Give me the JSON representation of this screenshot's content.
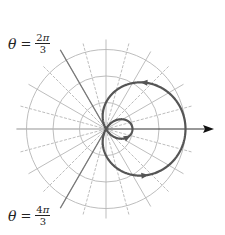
{
  "chart_data": {
    "type": "line",
    "subtype": "polar",
    "title": "",
    "equation_implied": "r = 1 + 2cos(theta)",
    "curve_name": "limacon with inner loop",
    "grid": {
      "rings": [
        1,
        2,
        3
      ],
      "radial_step_degrees": 15,
      "on": true
    },
    "polar_axis": {
      "direction": "right",
      "arrow": true
    },
    "highlighted_rays": [
      {
        "theta": "2π/3",
        "label": {
          "lhs": "θ",
          "eq": "=",
          "num_coef": "2",
          "num_sym": "π",
          "den": "3"
        }
      },
      {
        "theta": "4π/3",
        "label": {
          "lhs": "θ",
          "eq": "=",
          "num_coef": "4",
          "num_sym": "π",
          "den": "3"
        }
      }
    ],
    "key_points": [
      {
        "theta": "0",
        "r": 3
      },
      {
        "theta": "π/2",
        "r": 1
      },
      {
        "theta": "2π/3",
        "r": 0
      },
      {
        "theta": "π",
        "r": -1
      },
      {
        "theta": "4π/3",
        "r": 0
      },
      {
        "theta": "3π/2",
        "r": 1
      }
    ],
    "rlim": [
      0,
      3
    ]
  },
  "labels": {
    "top": {
      "lhs": "θ",
      "eq": "=",
      "num_coef": "2",
      "num_sym": "π",
      "den": "3"
    },
    "bottom": {
      "lhs": "θ",
      "eq": "=",
      "num_coef": "4",
      "num_sym": "π",
      "den": "3"
    }
  },
  "style": {
    "curve_color": "#555555",
    "grid_color": "#b5b5b5",
    "axis_color": "#333333",
    "ray_color": "#777777"
  }
}
